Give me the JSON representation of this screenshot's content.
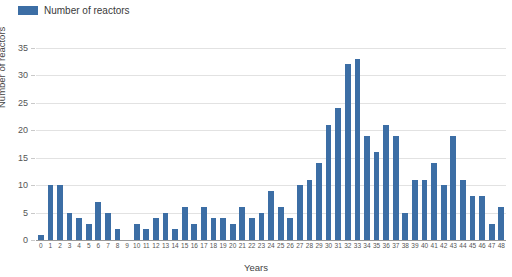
{
  "chart_data": {
    "type": "bar",
    "title": "",
    "subtitle": "",
    "xlabel": "Years",
    "ylabel": "Number of reactors",
    "legend": [
      "Number of reactors"
    ],
    "legend_position": "top-left",
    "grid": true,
    "ylim": [
      0,
      35
    ],
    "yticks": [
      0,
      5,
      10,
      15,
      20,
      25,
      30,
      35
    ],
    "series_color": "#3c6ea5",
    "categories": [
      "0",
      "1",
      "2",
      "3",
      "4",
      "5",
      "6",
      "7",
      "8",
      "9",
      "10",
      "11",
      "12",
      "13",
      "14",
      "15",
      "16",
      "17",
      "18",
      "19",
      "20",
      "21",
      "22",
      "23",
      "24",
      "25",
      "26",
      "27",
      "28",
      "29",
      "30",
      "31",
      "32",
      "33",
      "34",
      "35",
      "36",
      "37",
      "38",
      "39",
      "40",
      "41",
      "42",
      "43",
      "44",
      "45",
      "46",
      "47",
      "48"
    ],
    "series": [
      {
        "name": "Number of reactors",
        "color": "#3c6ea5",
        "values": [
          1,
          10,
          10,
          5,
          4,
          3,
          7,
          5,
          2,
          0,
          3,
          2,
          4,
          5,
          2,
          6,
          3,
          6,
          4,
          4,
          3,
          6,
          4,
          5,
          9,
          6,
          4,
          10,
          11,
          14,
          21,
          24,
          32,
          33,
          19,
          16,
          21,
          19,
          5,
          11,
          11,
          14,
          10,
          19,
          11,
          8,
          8,
          3,
          6
        ]
      }
    ]
  },
  "legend": {
    "label": "Number of reactors",
    "swatch_color": "#3c6ea5"
  },
  "axes": {
    "y_title": "Number of reactors",
    "x_title": "Years"
  }
}
